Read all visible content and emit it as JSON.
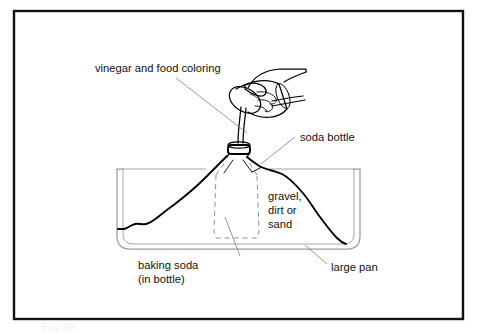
{
  "figure": {
    "type": "line-drawing",
    "background_color": "#ffffff",
    "ink_color": "#000000",
    "frame": {
      "name": "figure-border",
      "color": "#111111",
      "x": 14,
      "y": 11,
      "width": 449,
      "height": 308
    }
  },
  "labels": {
    "vinegar": {
      "text": "vinegar and food coloring",
      "x": 95,
      "y": 72
    },
    "soda_bottle": {
      "text": "soda bottle",
      "x": 300,
      "y": 141
    },
    "gravel_line1": {
      "text": "gravel,",
      "x": 268,
      "y": 200
    },
    "gravel_line2": {
      "text": "dirt or",
      "x": 268,
      "y": 214
    },
    "gravel_line3": {
      "text": "sand",
      "x": 268,
      "y": 228
    },
    "baking_soda_line1": {
      "text": "baking soda",
      "x": 138,
      "y": 269
    },
    "baking_soda_line2": {
      "text": "(in bottle)",
      "x": 138,
      "y": 283
    },
    "large_pan": {
      "text": "large pan",
      "x": 331,
      "y": 271
    }
  },
  "parts": {
    "pan": {
      "name": "large-pan",
      "description": "rectangular pan with rounded bottom corners, double outline"
    },
    "mound": {
      "name": "sand-mound",
      "description": "heap of gravel, dirt or sand covering the bottle"
    },
    "bottle": {
      "name": "soda-bottle",
      "description": "bottle buried in the mound, shown with dashed hidden outline"
    },
    "bottle_neck": {
      "name": "bottle-neck-collar",
      "description": "bottle mouth and ring protruding at the top of the mound"
    },
    "hand": {
      "name": "hand",
      "description": "hand holding and tipping a small cup"
    },
    "cup": {
      "name": "measuring-cup",
      "description": "small cup tilted to pour"
    },
    "stream": {
      "name": "pour-stream",
      "description": "liquid pouring from cup into bottle neck"
    }
  },
  "leaders": [
    {
      "name": "leader-vinegar",
      "from": [
        176,
        78
      ],
      "to": [
        247,
        133
      ]
    },
    {
      "name": "leader-soda-bottle",
      "from": [
        295,
        137
      ],
      "to": [
        261,
        164
      ]
    },
    {
      "name": "leader-baking-soda",
      "from": [
        240,
        256
      ],
      "to": [
        225,
        217
      ]
    },
    {
      "name": "leader-large-pan",
      "from": [
        327,
        264
      ],
      "to": [
        305,
        245
      ]
    }
  ]
}
